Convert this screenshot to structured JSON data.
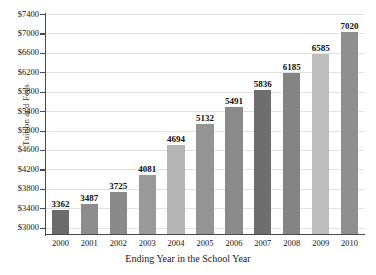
{
  "chart_data": {
    "type": "bar",
    "title": "",
    "xlabel": "Ending Year in the School Year",
    "ylabel": "Tuition and Fees",
    "categories": [
      "2000",
      "2001",
      "2002",
      "2003",
      "2004",
      "2005",
      "2006",
      "2007",
      "2008",
      "2009",
      "2010"
    ],
    "values": [
      3362,
      3487,
      3725,
      4081,
      4694,
      5132,
      5491,
      5836,
      6185,
      6585,
      7020
    ],
    "value_labels": [
      "3362",
      "3487",
      "3725",
      "4081",
      "4694",
      "5132",
      "5491",
      "5836",
      "6185",
      "6585",
      "7020"
    ],
    "bar_colors": [
      "#6b6b6b",
      "#8d8d8d",
      "#8a8a8a",
      "#9a9a9a",
      "#b5b5b5",
      "#949494",
      "#8b8b8b",
      "#6e6e6e",
      "#848484",
      "#bdbdbd",
      "#8f8f8f"
    ],
    "ylim": [
      2870,
      7400
    ],
    "ytick_values": [
      3000,
      3400,
      3800,
      4200,
      4600,
      5000,
      5400,
      5800,
      6200,
      6600,
      7000,
      7400
    ],
    "ytick_labels": [
      "$3000",
      "$3400",
      "$3800",
      "$4200",
      "$4600",
      "$5000",
      "$5400",
      "$5800",
      "$6200",
      "$6600",
      "$7000",
      "$7400"
    ],
    "grid": true,
    "grid_axis": "y",
    "legend": "none",
    "gridline_color": "#e2e2e2",
    "axis_color": "#4a4a4a"
  }
}
